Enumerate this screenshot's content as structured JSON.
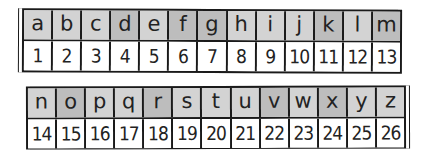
{
  "colors": {
    "border": "#1a1a1a",
    "header_light": "#d3d3d3",
    "header_dark": "#bdbdbd",
    "number_bg": "#ffffff",
    "text": "#222222"
  },
  "strips": [
    {
      "letters": [
        {
          "label": "a",
          "shade": "light"
        },
        {
          "label": "b",
          "shade": "light"
        },
        {
          "label": "c",
          "shade": "light"
        },
        {
          "label": "d",
          "shade": "dark"
        },
        {
          "label": "e",
          "shade": "light"
        },
        {
          "label": "f",
          "shade": "dark"
        },
        {
          "label": "g",
          "shade": "dark"
        },
        {
          "label": "h",
          "shade": "light"
        },
        {
          "label": "i",
          "shade": "light"
        },
        {
          "label": "j",
          "shade": "light"
        },
        {
          "label": "k",
          "shade": "dark"
        },
        {
          "label": "l",
          "shade": "light"
        },
        {
          "label": "m",
          "shade": "dark"
        }
      ],
      "numbers": [
        "1",
        "2",
        "3",
        "4",
        "5",
        "6",
        "7",
        "8",
        "9",
        "10",
        "11",
        "12",
        "13"
      ]
    },
    {
      "letters": [
        {
          "label": "n",
          "shade": "light"
        },
        {
          "label": "o",
          "shade": "dark"
        },
        {
          "label": "p",
          "shade": "light"
        },
        {
          "label": "q",
          "shade": "light"
        },
        {
          "label": "r",
          "shade": "dark"
        },
        {
          "label": "s",
          "shade": "light"
        },
        {
          "label": "t",
          "shade": "light"
        },
        {
          "label": "u",
          "shade": "light"
        },
        {
          "label": "v",
          "shade": "dark"
        },
        {
          "label": "w",
          "shade": "light"
        },
        {
          "label": "x",
          "shade": "dark"
        },
        {
          "label": "y",
          "shade": "light"
        },
        {
          "label": "z",
          "shade": "light"
        }
      ],
      "numbers": [
        "14",
        "15",
        "16",
        "17",
        "18",
        "19",
        "20",
        "21",
        "22",
        "23",
        "24",
        "25",
        "26"
      ]
    }
  ]
}
